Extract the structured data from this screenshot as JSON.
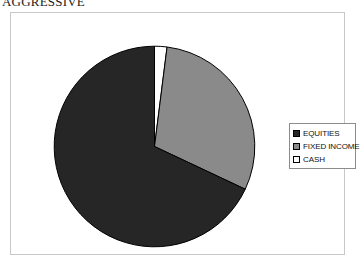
{
  "title": "AGGRESSIVE",
  "colors": {
    "equities": "#262626",
    "fixed_income": "#8a8a8a",
    "cash": "#ffffff",
    "slice_outline": "#000000",
    "frame_border": "#c8c8c8",
    "legend_border": "#8c8c8c",
    "background": "#ffffff"
  },
  "legend": {
    "items": [
      {
        "label": "EQUITIES",
        "swatch": "#262626",
        "icon": "legend-swatch-icon"
      },
      {
        "label": "FIXED INCOME",
        "swatch": "#8a8a8a",
        "icon": "legend-swatch-icon"
      },
      {
        "label": "CASH",
        "swatch": "#ffffff",
        "icon": "legend-swatch-icon"
      }
    ]
  },
  "chart_data": {
    "type": "pie",
    "title": "AGGRESSIVE",
    "categories": [
      "EQUITIES",
      "FIXED INCOME",
      "CASH"
    ],
    "values": [
      68,
      30,
      2
    ],
    "unit": "percent",
    "colors": [
      "#262626",
      "#8a8a8a",
      "#ffffff"
    ],
    "start_angle_deg": 0,
    "direction": "clockwise",
    "legend_position": "right",
    "grid": false,
    "data_labels_shown": false
  }
}
